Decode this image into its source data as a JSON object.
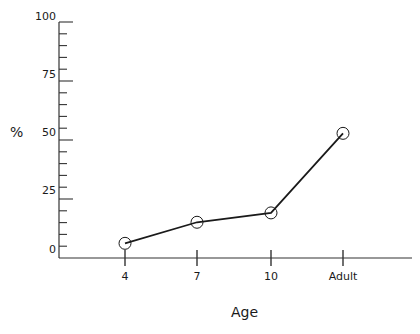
{
  "chart_data": {
    "type": "line",
    "title": "",
    "xlabel": "Age",
    "ylabel": "%",
    "categories": [
      "4",
      "7",
      "10",
      "Adult"
    ],
    "series": [
      {
        "name": "%",
        "values": [
          2,
          11,
          15,
          49
        ],
        "marker": "open-circle"
      }
    ],
    "ylim": [
      0,
      100
    ],
    "yticks": [
      0,
      25,
      50,
      75,
      100
    ],
    "grid": false,
    "legend": null
  },
  "axes": {
    "y_tick_labels": [
      "100",
      "75",
      "50",
      "25",
      "0"
    ],
    "x_tick_labels": [
      "4",
      "7",
      "10",
      "Adult"
    ],
    "x_title": "Age",
    "y_title": "%"
  },
  "colors": {
    "line": "#1a1a1a",
    "axis": "#333333",
    "background": "#ffffff"
  }
}
